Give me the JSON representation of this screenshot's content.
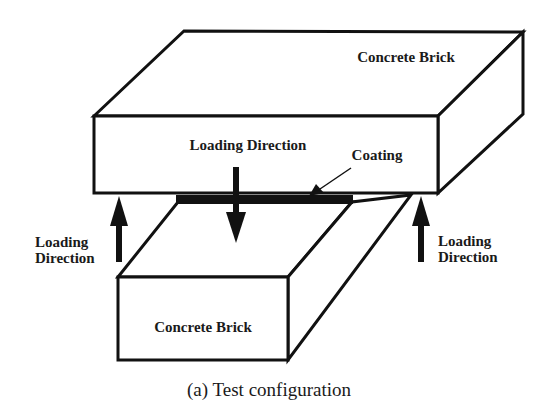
{
  "figure": {
    "caption": "(a) Test configuration",
    "colors": {
      "line": "#111111",
      "background": "#ffffff",
      "text": "#1a1a1a"
    },
    "upper_brick": {
      "label": "Concrete Brick"
    },
    "lower_brick": {
      "label": "Concrete Brick"
    },
    "coating": {
      "label": "Coating"
    },
    "loading_arrows": {
      "center": {
        "label": "Loading Direction",
        "direction": "down"
      },
      "left": {
        "line1": "Loading",
        "line2": "Direction",
        "direction": "up"
      },
      "right": {
        "line1": "Loading",
        "line2": "Direction",
        "direction": "up"
      }
    }
  }
}
